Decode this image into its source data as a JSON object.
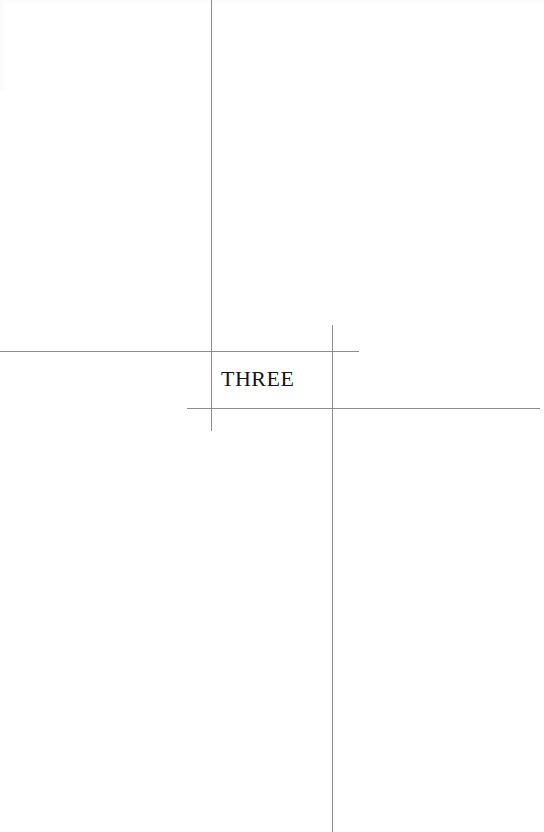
{
  "page": {
    "kind": "book-chapter-divider",
    "background_color": "#ffffff",
    "width": 544,
    "height": 832
  },
  "chapter": {
    "label": "THREE",
    "style": "small-caps",
    "text_color": "#15151a"
  },
  "rules": {
    "color": "#8d8d90",
    "items": [
      {
        "name": "vertical-left",
        "orientation": "vertical",
        "x": 211,
        "y": 0,
        "length": 431
      },
      {
        "name": "vertical-right",
        "orientation": "vertical",
        "x": 332,
        "y": 325,
        "length": 507
      },
      {
        "name": "horizontal-upper",
        "orientation": "horizontal",
        "x": 0,
        "y": 351,
        "length": 359
      },
      {
        "name": "horizontal-lower",
        "orientation": "horizontal",
        "x": 187,
        "y": 408,
        "length": 353
      }
    ]
  }
}
